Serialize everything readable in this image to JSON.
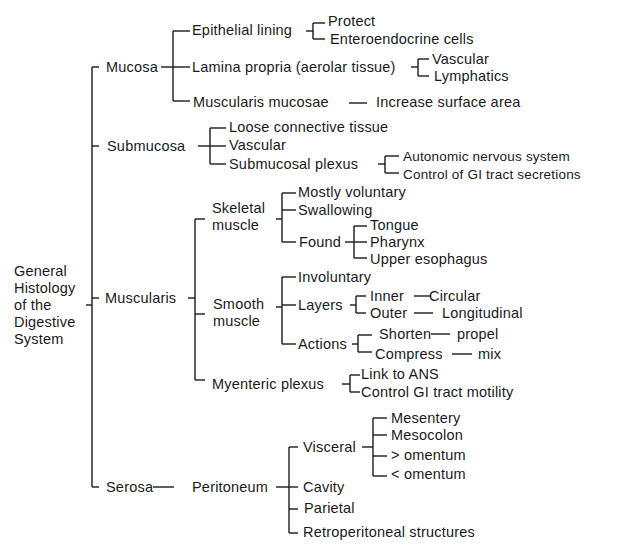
{
  "diagram": {
    "root": [
      "General",
      "Histology",
      "of the",
      "Digestive",
      "System"
    ],
    "mucosa": {
      "label": "Mucosa",
      "epithelial": "Epithelial lining",
      "protect": "Protect",
      "enteroendocrine": "Enteroendocrine cells",
      "lamina": "Lamina propria (aerolar tissue)",
      "vascular": "Vascular",
      "lymphatics": "Lymphatics",
      "muscularis_mucosae": "Muscularis mucosae",
      "increase": "Increase surface area"
    },
    "submucosa": {
      "label": "Submucosa",
      "loose": "Loose connective tissue",
      "vascular": "Vascular",
      "plexus": "Submucosal plexus",
      "autonomic": "Autonomic nervous system",
      "control": "Control of GI tract secretions"
    },
    "muscularis": {
      "label": "Muscularis",
      "skeletal": [
        "Skeletal",
        "muscle"
      ],
      "mostly_voluntary": "Mostly voluntary",
      "swallowing": "Swallowing",
      "found": "Found",
      "tongue": "Tongue",
      "pharynx": "Pharynx",
      "upper_esophagus": "Upper esophagus",
      "smooth": [
        "Smooth",
        "muscle"
      ],
      "involuntary": "Involuntary",
      "layers": "Layers",
      "inner": "Inner",
      "circular": "Circular",
      "outer": "Outer",
      "longitudinal": "Longitudinal",
      "actions": "Actions",
      "shorten": "Shorten",
      "propel": "propel",
      "compress": "Compress",
      "mix": "mix",
      "myenteric": "Myenteric plexus",
      "link_ans": "Link to ANS",
      "control_motility": "Control GI tract motility"
    },
    "serosa": {
      "label": "Serosa",
      "peritoneum": "Peritoneum",
      "visceral": "Visceral",
      "mesentery": "Mesentery",
      "mesocolon": "Mesocolon",
      "greater_omentum": "> omentum",
      "lesser_omentum": "< omentum",
      "cavity": "Cavity",
      "parietal": "Parietal",
      "retroperitoneal": "Retroperitoneal structures"
    }
  }
}
